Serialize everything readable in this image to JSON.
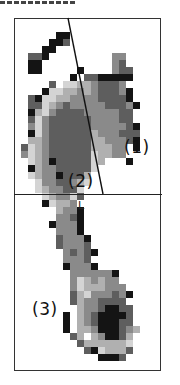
{
  "figure": {
    "type": "foot pressure map",
    "cell_size_px": 7,
    "origin": [
      14,
      18
    ],
    "palette": {
      ".": "#ffffff",
      "1": "#d4d4d4",
      "2": "#b0b0b0",
      "3": "#8a8a8a",
      "4": "#5e5e5e",
      "5": "#141414"
    },
    "rows": [
      ".....................",
      ".....................",
      "......55.............",
      ".....554.............",
      "....55...............",
      "..445.........33.....",
      "..55..........34.....",
      "..55.....5....344....",
      "........5.4455555....",
      ".....4.112234443.....",
      "....5112232344435....",
      "..451122333344445....",
      "..4412343333344435...",
      "..521344443333344....",
      "..413444444333344....",
      "..3134444443333345...",
      "..5134444442333444...",
      "..2234444442233345...",
      ".412344444422233.5...",
      ".312344444412233.....",
      "..12354444412...5....",
      "..5233444441.........",
      "..123354442..........",
      "...13344321..........",
      "...1233441...........",
      "....123314...........",
      "....51223............",
      "......2335...........",
      "......3345...........",
      ".....53335...........",
      "......3335...........",
      "......43335..........",
      "......43334..........",
      ".......34345.........",
      ".......3334..........",
      ".......53335.........",
      "........3333335......",
      "........3123233......",
      "........31222333.....",
      "........421333435....",
      "........42334444.....",
      ".........23345544....",
      ".......5.23455554....",
      ".......5.23455544....",
      ".......5.223555432...",
      "........42.235542....",
      ".........42222221....",
      "..........4512224....",
      "............5554.....",
      ".....................",
      "....................."
    ]
  },
  "annotations": {
    "region_1": "(1)",
    "region_2": "(2)",
    "region_3": "(3)",
    "side_marker": "L"
  },
  "lines": {
    "diagonal": {
      "x1": 68,
      "y1": 18,
      "x2": 103,
      "y2": 194
    },
    "horizontal_divider_y": 194
  }
}
